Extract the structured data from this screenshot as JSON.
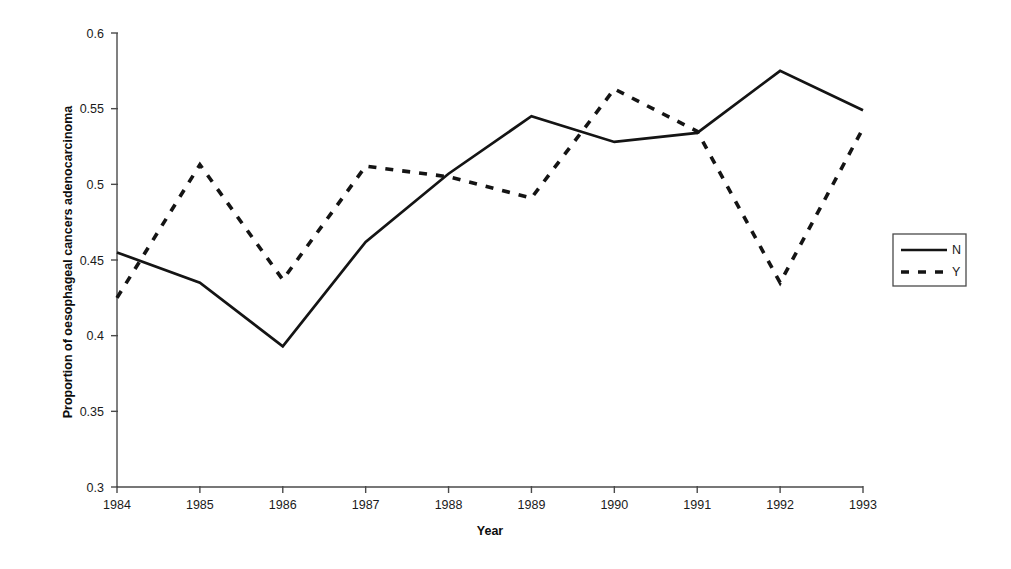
{
  "chart_data": {
    "type": "line",
    "title": "",
    "xlabel": "Year",
    "ylabel": "Proportion of oesophageal cancers adenocarcinoma",
    "categories": [
      "1984",
      "1985",
      "1986",
      "1987",
      "1988",
      "1989",
      "1990",
      "1991",
      "1992",
      "1993"
    ],
    "x": [
      1984,
      1985,
      1986,
      1987,
      1988,
      1989,
      1990,
      1991,
      1992,
      1993
    ],
    "series": [
      {
        "name": "N",
        "style": "solid",
        "values": [
          0.455,
          0.435,
          0.393,
          0.462,
          0.507,
          0.545,
          0.528,
          0.534,
          0.575,
          0.549
        ]
      },
      {
        "name": "Y",
        "style": "dashed",
        "values": [
          0.425,
          0.513,
          0.437,
          0.512,
          0.505,
          0.491,
          0.563,
          0.535,
          0.435,
          0.537
        ]
      }
    ],
    "xlim": [
      1984,
      1993
    ],
    "ylim": [
      0.3,
      0.6
    ],
    "ytick_labels": [
      "0.3",
      "0.35",
      "0.4",
      "0.45",
      "0.5",
      "0.55",
      "0.6"
    ],
    "ytick_values": [
      0.3,
      0.35,
      0.4,
      0.45,
      0.5,
      0.55,
      0.6
    ],
    "grid": false,
    "legend_position": "right",
    "line_color": "#141414",
    "axis_color": "#4a4a4a",
    "background": "#ffffff"
  },
  "legend": {
    "entries": [
      {
        "label": "N",
        "style": "solid"
      },
      {
        "label": "Y",
        "style": "dashed"
      }
    ]
  }
}
